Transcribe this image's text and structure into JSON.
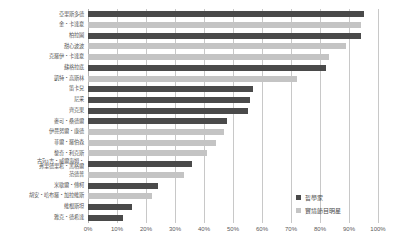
{
  "chart": {
    "title": "",
    "legend": {
      "position": "bottom-right",
      "entries": [
        {
          "label": "哲學家",
          "key": "phil",
          "color": "#4a4a4a"
        },
        {
          "label": "實境節目明星",
          "key": "star",
          "color": "#c4c4c4"
        }
      ]
    }
  },
  "chart_data": {
    "type": "bar",
    "orientation": "horizontal",
    "title": "",
    "xlabel": "",
    "ylabel": "",
    "xlim": [
      0,
      100
    ],
    "xticks": [
      "0%",
      "10%",
      "20%",
      "30%",
      "40%",
      "50%",
      "60%",
      "70%",
      "80%",
      "90%",
      "100%"
    ],
    "xtick_values": [
      0,
      10,
      20,
      30,
      40,
      50,
      60,
      70,
      80,
      90,
      100
    ],
    "grid": true,
    "series_keys": [
      "phil",
      "star"
    ],
    "series_labels": {
      "phil": "哲學家",
      "star": "實境節目明星"
    },
    "colors": {
      "phil": "#4a4a4a",
      "star": "#c4c4c4"
    },
    "categories": [
      "亞里斯多德",
      "金・卡達夏",
      "柏拉圖",
      "甜心波波",
      "克羅伊・卡達夏",
      "蘇格拉底",
      "凱特・高斯林",
      "笛卡兒",
      "尼采",
      "齊克果",
      "麥可・桑德爾",
      "伊曼努爾・康德",
      "菲爾・羅伯森",
      "黎奇・利克斯",
      "古ទីរេ吉・威爾海姆・\n弗里德里希・黑格爾",
      "范德普",
      "米歇爾・傅柯",
      "胡安・哈布羅・加拉維斯",
      "維根斯坦",
      "雅克・德希達"
    ],
    "values": [
      95,
      94,
      94,
      89,
      83,
      82,
      72,
      57,
      56,
      55,
      48,
      47,
      44,
      41,
      36,
      33,
      24,
      22,
      15,
      12
    ],
    "series_of_category": [
      "phil",
      "star",
      "phil",
      "star",
      "star",
      "phil",
      "star",
      "phil",
      "phil",
      "phil",
      "phil",
      "star",
      "star",
      "star",
      "phil",
      "star",
      "phil",
      "star",
      "phil",
      "phil"
    ]
  }
}
